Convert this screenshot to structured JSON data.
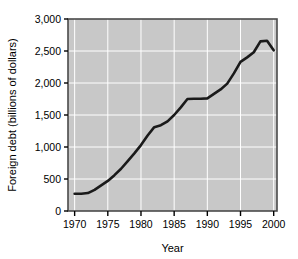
{
  "chart_data": {
    "type": "line",
    "title": "",
    "xlabel": "Year",
    "ylabel": "Foreign debt (billions of dollars)",
    "xlim": [
      1969,
      2000.5
    ],
    "ylim": [
      0,
      3000
    ],
    "grid": true,
    "legend": "none",
    "plot_background": "#c8c8c8",
    "gridline_color": "#ffffff",
    "line_color": "#1a1a1a",
    "x_ticks": [
      1970,
      1975,
      1980,
      1985,
      1990,
      1995,
      2000
    ],
    "x_tick_labels": [
      "1970",
      "1975",
      "1980",
      "1985",
      "1990",
      "1995",
      "2000"
    ],
    "y_ticks": [
      0,
      500,
      1000,
      1500,
      2000,
      2500,
      3000
    ],
    "y_tick_labels": [
      "0",
      "500",
      "1,000",
      "1,500",
      "2,000",
      "2,500",
      "3,000"
    ],
    "series": [
      {
        "name": "Foreign debt",
        "x": [
          1970,
          1971,
          1972,
          1973,
          1974,
          1975,
          1976,
          1977,
          1978,
          1979,
          1980,
          1981,
          1982,
          1983,
          1984,
          1985,
          1986,
          1987,
          1988,
          1989,
          1990,
          1991,
          1992,
          1993,
          1994,
          1995,
          1996,
          1997,
          1998,
          1999,
          2000
        ],
        "values": [
          270,
          270,
          280,
          330,
          400,
          470,
          560,
          660,
          780,
          900,
          1030,
          1180,
          1310,
          1340,
          1400,
          1500,
          1620,
          1750,
          1755,
          1755,
          1760,
          1830,
          1900,
          1990,
          2150,
          2330,
          2400,
          2480,
          2650,
          2660,
          2510
        ]
      }
    ]
  }
}
